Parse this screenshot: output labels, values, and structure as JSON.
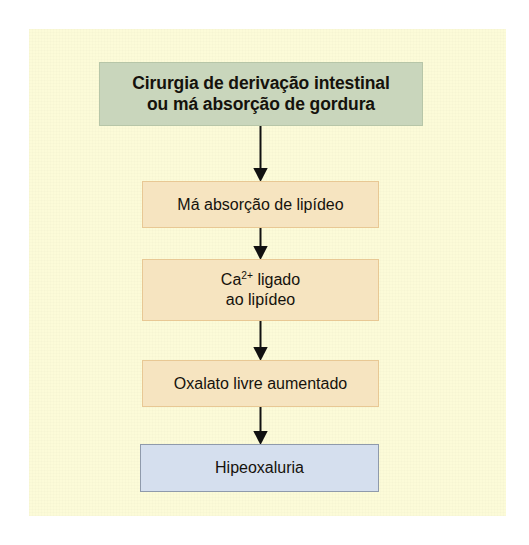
{
  "figure": {
    "kind": "flowchart",
    "orientation": "vertical-top-to-bottom",
    "language": "pt-BR",
    "panel_background_color": "#fcfbd8",
    "outer_background_color": "#ffffff"
  },
  "nodes": [
    {
      "id": "bypass",
      "label": "Cirurgia de derivação intestinal\nou má absorção de gordura",
      "line1": "Cirurgia de derivação intestinal",
      "line2": "ou má absorção de gordura",
      "fill_color": "#c9d6bc",
      "border_color": "#b7c6a8",
      "text_color": "#15120c",
      "bold": true
    },
    {
      "id": "malabsorption",
      "label": "Má absorção de lipídeo",
      "fill_color": "#f6e4c0",
      "border_color": "#e8c894",
      "text_color": "#15120c",
      "bold": false
    },
    {
      "id": "ca-bound",
      "label": "Ca2+ ligado\nao lipídeo",
      "rich_prefix": "Ca",
      "rich_superscript": "2+",
      "rich_suffix": " ligado",
      "line2": "ao lipídeo",
      "fill_color": "#f6e4c0",
      "border_color": "#e8c894",
      "text_color": "#15120c",
      "bold": false
    },
    {
      "id": "oxalate",
      "label": "Oxalato livre aumentado",
      "fill_color": "#f6e4c0",
      "border_color": "#e8c894",
      "text_color": "#15120c",
      "bold": false
    },
    {
      "id": "hyperoxaluria",
      "label": "Hipeoxaluria",
      "fill_color": "#d5dfee",
      "border_color": "#8f9aab",
      "text_color": "#15120c",
      "bold": false
    }
  ],
  "edges": [
    {
      "id": "edge-1",
      "from": "bypass",
      "to": "malabsorption",
      "style": "solid-arrow",
      "color": "#111111"
    },
    {
      "id": "edge-2",
      "from": "malabsorption",
      "to": "ca-bound",
      "style": "solid-arrow",
      "color": "#111111"
    },
    {
      "id": "edge-3",
      "from": "ca-bound",
      "to": "oxalate",
      "style": "solid-arrow",
      "color": "#111111"
    },
    {
      "id": "edge-4",
      "from": "oxalate",
      "to": "hyperoxaluria",
      "style": "solid-arrow",
      "color": "#111111"
    }
  ]
}
